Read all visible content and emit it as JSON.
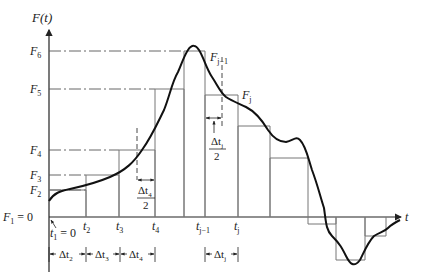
{
  "figure": {
    "y_axis_label": "F(t)",
    "x_axis_label": "t",
    "colors": {
      "curve": "#111111",
      "axes": "#222222",
      "rect": "#777777",
      "guide": "#555555"
    }
  },
  "y_levels": [
    {
      "label_base": "F",
      "sub": "6",
      "y": 51
    },
    {
      "label_base": "F",
      "sub": "5",
      "y": 89
    },
    {
      "label_base": "F",
      "sub": "4",
      "y": 150
    },
    {
      "label_base": "F",
      "sub": "3",
      "y": 175
    },
    {
      "label_base": "F",
      "sub": "2",
      "y": 190
    },
    {
      "label_base": "F",
      "sub": "1",
      "suffix": " = 0",
      "y": 217
    }
  ],
  "x_ticks": [
    {
      "base": "t",
      "sub": "1",
      "suffix": " = 0"
    },
    {
      "base": "t",
      "sub": "2"
    },
    {
      "base": "t",
      "sub": "3"
    },
    {
      "base": "t",
      "sub": "4"
    },
    {
      "base": "t",
      "sub": "j−1"
    },
    {
      "base": "t",
      "sub": "j"
    }
  ],
  "curve_labels": {
    "f_j_minus_1": {
      "base": "F",
      "sub": "j−1"
    },
    "f_j": {
      "base": "F",
      "sub": "j"
    }
  },
  "half_step_labels": {
    "dt4_half": {
      "num_base": "Δt",
      "num_sub": "4",
      "den": "2"
    },
    "dtj_half": {
      "num_base": "Δt",
      "num_sub": "j",
      "den": "2"
    }
  },
  "intervals": [
    {
      "base": "Δt",
      "sub": "2"
    },
    {
      "base": "Δt",
      "sub": "3"
    },
    {
      "base": "Δt",
      "sub": "4"
    },
    {
      "base": "Δt",
      "sub": "j"
    }
  ]
}
